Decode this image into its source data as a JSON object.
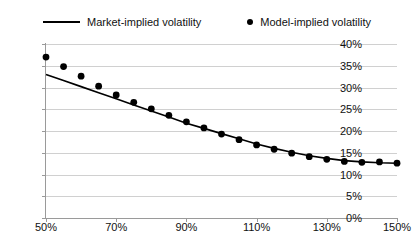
{
  "legend": {
    "position": "top",
    "entries": [
      {
        "label": "Market-implied volatility",
        "marker": "line-icon"
      },
      {
        "label": "Model-implied volatility",
        "marker": "dot-icon"
      }
    ]
  },
  "axes": {
    "y_ticks": [
      "0%",
      "5%",
      "10%",
      "15%",
      "20%",
      "25%",
      "30%",
      "35%",
      "40%"
    ],
    "x_ticks": [
      "50%",
      "70%",
      "90%",
      "110%",
      "130%",
      "150%"
    ]
  },
  "colors": {
    "series": "#000000",
    "gridline": "#d0d0d0",
    "axis": "#9a9a9a",
    "background": "#ffffff"
  },
  "chart_data": {
    "type": "line",
    "title": "",
    "xlabel": "",
    "ylabel": "",
    "xlim": [
      50,
      150
    ],
    "ylim": [
      0,
      40
    ],
    "y_tick_step": 5,
    "x_tick_step": 20,
    "grid": "horizontal",
    "legend_position": "top",
    "x": [
      50,
      55,
      60,
      65,
      70,
      75,
      80,
      85,
      90,
      95,
      100,
      105,
      110,
      115,
      120,
      125,
      130,
      135,
      140,
      145,
      150
    ],
    "series": [
      {
        "name": "Market-implied volatility",
        "style": "line",
        "values": [
          33.0,
          31.6,
          30.2,
          28.8,
          27.4,
          26.0,
          24.6,
          23.2,
          21.8,
          20.6,
          19.4,
          18.2,
          17.0,
          16.0,
          15.1,
          14.3,
          13.7,
          13.2,
          12.9,
          12.7,
          12.6
        ]
      },
      {
        "name": "Model-implied volatility",
        "style": "markers",
        "values": [
          37.0,
          34.8,
          32.6,
          30.3,
          28.3,
          26.6,
          25.1,
          23.6,
          22.1,
          20.7,
          19.3,
          18.0,
          16.8,
          15.8,
          14.9,
          14.1,
          13.5,
          13.0,
          12.8,
          12.9,
          12.6
        ]
      }
    ]
  }
}
